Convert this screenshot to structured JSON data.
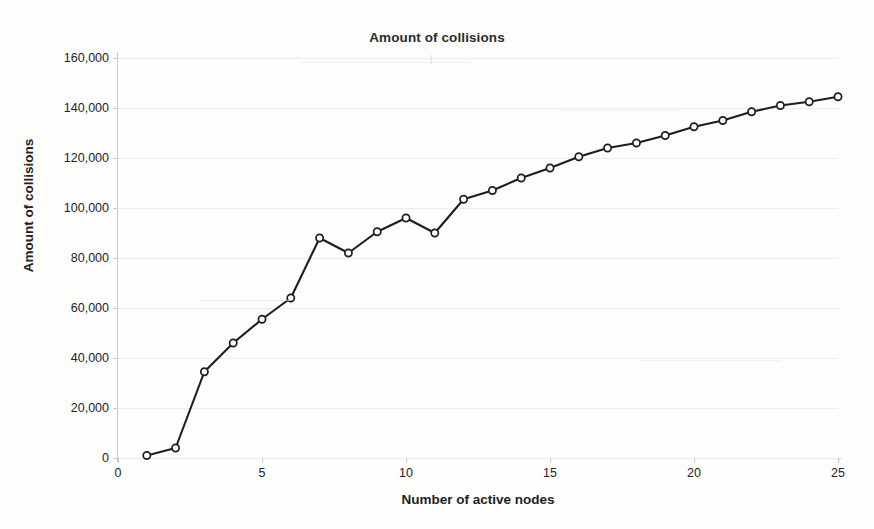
{
  "chart_data": {
    "type": "line",
    "title": "Amount of collisions",
    "xlabel": "Number of active nodes",
    "ylabel": "Amount of collisions",
    "xlim": [
      0,
      25
    ],
    "ylim": [
      0,
      160000
    ],
    "grid": true,
    "legend": "none",
    "marker": "open-circle",
    "line_color": "#1d1d1d",
    "x_ticks": [
      0,
      5,
      10,
      15,
      20,
      25
    ],
    "x_tick_labels": [
      "0",
      "5",
      "10",
      "15",
      "20",
      "25"
    ],
    "y_ticks": [
      0,
      20000,
      40000,
      60000,
      80000,
      100000,
      120000,
      140000,
      160000
    ],
    "y_tick_labels": [
      "0",
      "20,000",
      "40,000",
      "60,000",
      "80,000",
      "100,000",
      "120,000",
      "140,000",
      "160,000"
    ],
    "x": [
      1,
      2,
      3,
      4,
      5,
      6,
      7,
      8,
      9,
      10,
      11,
      12,
      13,
      14,
      15,
      16,
      17,
      18,
      19,
      20,
      21,
      22,
      23,
      24,
      25
    ],
    "values": [
      1000,
      4000,
      34500,
      46000,
      55500,
      64000,
      88000,
      82000,
      90500,
      96000,
      90000,
      103500,
      107000,
      112000,
      116000,
      120500,
      124000,
      126000,
      129000,
      132500,
      135000,
      138500,
      141000,
      142500,
      144500
    ],
    "series": [
      {
        "name": "Amount of collisions",
        "values": [
          1000,
          4000,
          34500,
          46000,
          55500,
          64000,
          88000,
          82000,
          90500,
          96000,
          90000,
          103500,
          107000,
          112000,
          116000,
          120500,
          124000,
          126000,
          129000,
          132500,
          135000,
          138500,
          141000,
          142500,
          144500
        ]
      }
    ]
  }
}
